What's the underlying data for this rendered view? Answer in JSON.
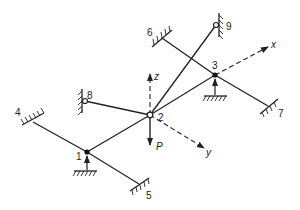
{
  "diagram": {
    "type": "space-frame",
    "nodes": [
      {
        "id": "1",
        "label": "1",
        "kind": "roller-support"
      },
      {
        "id": "2",
        "label": "2",
        "kind": "pin-joint-loaded"
      },
      {
        "id": "3",
        "label": "3",
        "kind": "roller-support"
      },
      {
        "id": "4",
        "label": "4",
        "kind": "fixed-support"
      },
      {
        "id": "5",
        "label": "5",
        "kind": "fixed-support"
      },
      {
        "id": "6",
        "label": "6",
        "kind": "fixed-support"
      },
      {
        "id": "7",
        "label": "7",
        "kind": "fixed-support"
      },
      {
        "id": "8",
        "label": "8",
        "kind": "pinned-wall-support"
      },
      {
        "id": "9",
        "label": "9",
        "kind": "pinned-wall-support"
      }
    ],
    "members": [
      [
        "4",
        "1"
      ],
      [
        "1",
        "5"
      ],
      [
        "1",
        "2"
      ],
      [
        "2",
        "8"
      ],
      [
        "2",
        "9"
      ],
      [
        "2",
        "3"
      ],
      [
        "6",
        "3"
      ],
      [
        "3",
        "7"
      ]
    ],
    "axes": {
      "x": "x",
      "y": "y",
      "z": "z"
    },
    "load": {
      "label": "P",
      "node": "2",
      "direction": "down"
    }
  }
}
